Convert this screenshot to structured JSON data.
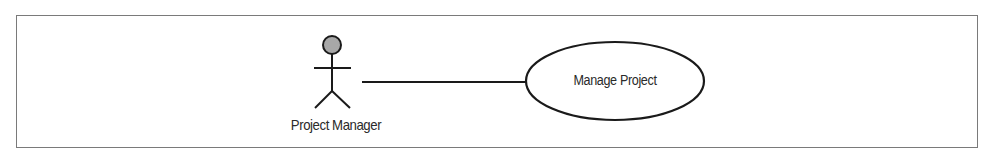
{
  "diagram": {
    "type": "uml-use-case",
    "actor": {
      "label": "Project Manager",
      "icon": "stick-figure-icon",
      "head_color": "#a8a8a8"
    },
    "use_case": {
      "label": "Manage Project"
    },
    "association": {
      "from": "Project Manager",
      "to": "Manage Project"
    },
    "colors": {
      "stroke": "#1a1a1a",
      "frame": "#7a7a7a",
      "text": "#2a2a2a"
    }
  }
}
